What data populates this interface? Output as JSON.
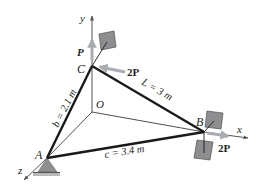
{
  "diagram": {
    "colors": {
      "member": "#1a1a1a",
      "axis": "#555555",
      "thin_line": "#3a3a3a",
      "force_arrow": "#a9adb2",
      "plate_fill": "#8d8e90",
      "plate_stroke": "#3c3c3c",
      "support_fill": "#8e8f91",
      "ground_fill": "#b8b9bb",
      "text": "#231f20"
    },
    "axes": {
      "x": "x",
      "y": "y",
      "z": "z"
    },
    "points": {
      "A": "A",
      "B": "B",
      "C": "C",
      "O": "O"
    },
    "members": {
      "b": "b = 2.1 m",
      "L": "L = 3 m",
      "c": "c = 3.4 m"
    },
    "loads": {
      "P_at_C": "P",
      "twoP_at_C": "2P",
      "twoP_at_B": "2P"
    }
  }
}
